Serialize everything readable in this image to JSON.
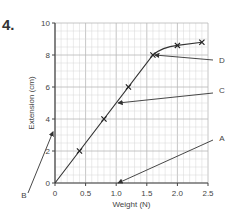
{
  "question_number": "4.",
  "chart_data": {
    "type": "line",
    "title": "",
    "xlabel": "Weight (N)",
    "ylabel": "Extension (cm)",
    "xlim": [
      0,
      2.5
    ],
    "ylim": [
      0,
      10
    ],
    "x_ticks": [
      "0",
      "0.5",
      "1.0",
      "1.5",
      "2.0",
      "2.5"
    ],
    "y_ticks": [
      "0",
      "2",
      "4",
      "6",
      "8",
      "10"
    ],
    "grid": true,
    "series": [
      {
        "name": "Extension vs Weight",
        "x": [
          0,
          0.4,
          0.8,
          1.2,
          1.6,
          2.0,
          2.4
        ],
        "y": [
          0,
          2,
          4,
          6,
          8,
          8.6,
          8.8
        ],
        "markers": "x"
      }
    ],
    "annotations": [
      {
        "label": "A",
        "points_to": [
          1.0,
          0
        ]
      },
      {
        "label": "B",
        "points_to": [
          0,
          3.2
        ]
      },
      {
        "label": "C",
        "points_to": [
          1.0,
          5
        ]
      },
      {
        "label": "D",
        "points_to": [
          1.6,
          8
        ]
      }
    ]
  }
}
